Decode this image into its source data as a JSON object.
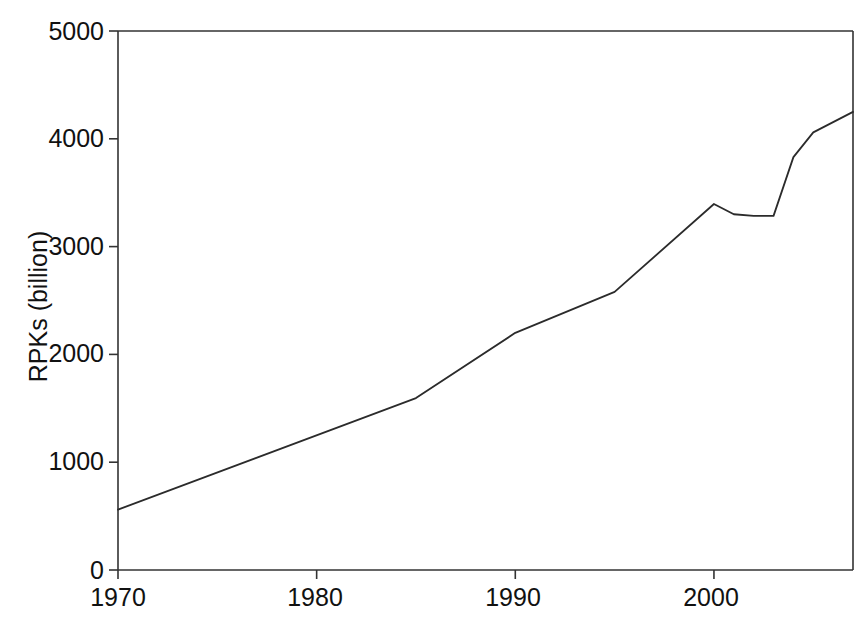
{
  "chart_data": {
    "type": "line",
    "title": "",
    "subtitle": "",
    "xlabel": "",
    "ylabel": "RPKs (billion)",
    "xlim": [
      1970,
      2007
    ],
    "ylim": [
      0,
      5000
    ],
    "grid": false,
    "legend": false,
    "legend_position": "none",
    "line_color": "#2b2b2b",
    "background_color": "#ffffff",
    "frame_color": "#333333",
    "x_ticks": [
      1970,
      1980,
      1990,
      2000
    ],
    "x_tick_labels": [
      "1970",
      "1980",
      "1990",
      "2000"
    ],
    "y_ticks": [
      0,
      1000,
      2000,
      3000,
      4000,
      5000
    ],
    "y_tick_labels": [
      "0",
      "1000",
      "2000",
      "3000",
      "4000",
      "5000"
    ],
    "series": [
      {
        "name": "World scheduled air traffic (RPKs)",
        "x": [
          1970,
          1985,
          1990,
          1995,
          2000,
          2001,
          2002,
          2003,
          2004,
          2005,
          2007
        ],
        "values": [
          560,
          1595,
          2200,
          2580,
          3395,
          3300,
          3285,
          3285,
          3830,
          4060,
          4250
        ]
      }
    ]
  },
  "axis": {
    "y_title": "RPKs (billion)"
  }
}
